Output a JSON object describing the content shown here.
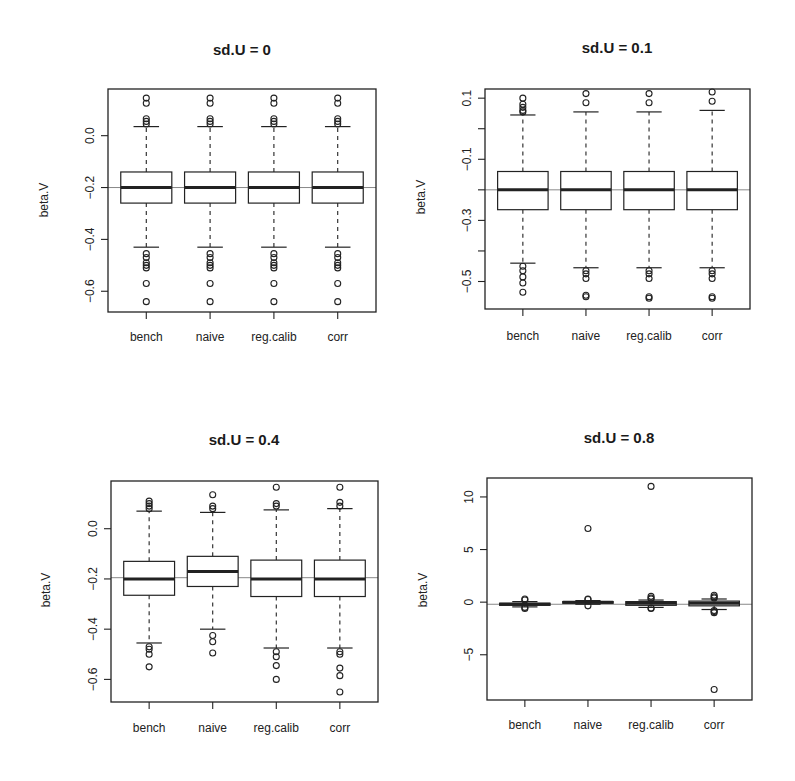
{
  "chart_data": [
    {
      "type": "boxplot",
      "title": "sd.U =  0",
      "xlabel": "",
      "ylabel": "beta.V",
      "categories": [
        "bench",
        "naive",
        "reg.calib",
        "corr"
      ],
      "ylim": [
        -0.68,
        0.18
      ],
      "yticks": [
        0.0,
        -0.2,
        -0.4,
        -0.6
      ],
      "ytick_labels": [
        "0.0",
        "-0.2",
        "-0.4",
        "-0.6"
      ],
      "reference_line": -0.2,
      "boxes": [
        {
          "q1": -0.26,
          "median": -0.2,
          "q3": -0.14,
          "whisker_low": -0.43,
          "whisker_high": 0.035,
          "outliers": [
            0.145,
            0.125,
            0.065,
            0.055,
            0.045,
            -0.455,
            -0.47,
            -0.49,
            -0.5,
            -0.51,
            -0.57,
            -0.64
          ]
        },
        {
          "q1": -0.26,
          "median": -0.2,
          "q3": -0.14,
          "whisker_low": -0.43,
          "whisker_high": 0.035,
          "outliers": [
            0.145,
            0.125,
            0.065,
            0.055,
            0.045,
            -0.455,
            -0.47,
            -0.49,
            -0.5,
            -0.51,
            -0.57,
            -0.64
          ]
        },
        {
          "q1": -0.26,
          "median": -0.2,
          "q3": -0.14,
          "whisker_low": -0.43,
          "whisker_high": 0.035,
          "outliers": [
            0.145,
            0.125,
            0.065,
            0.055,
            0.045,
            -0.455,
            -0.47,
            -0.49,
            -0.5,
            -0.51,
            -0.57,
            -0.64
          ]
        },
        {
          "q1": -0.26,
          "median": -0.2,
          "q3": -0.14,
          "whisker_low": -0.43,
          "whisker_high": 0.035,
          "outliers": [
            0.145,
            0.125,
            0.065,
            0.055,
            0.045,
            -0.455,
            -0.47,
            -0.49,
            -0.5,
            -0.51,
            -0.57,
            -0.64
          ]
        }
      ]
    },
    {
      "type": "boxplot",
      "title": "sd.U =  0.1",
      "xlabel": "",
      "ylabel": "beta.V",
      "categories": [
        "bench",
        "naive",
        "reg.calib",
        "corr"
      ],
      "ylim": [
        -0.59,
        0.13
      ],
      "yticks": [
        0.1,
        0.0,
        -0.1,
        -0.2,
        -0.3,
        -0.4,
        -0.5
      ],
      "ytick_labels": [
        "0.1",
        "",
        "-0.1",
        "",
        "-0.3",
        "",
        "-0.5"
      ],
      "reference_line": -0.2,
      "boxes": [
        {
          "q1": -0.265,
          "median": -0.2,
          "q3": -0.14,
          "whisker_low": -0.44,
          "whisker_high": 0.045,
          "outliers": [
            0.1,
            0.08,
            0.07,
            0.06,
            0.055,
            -0.45,
            -0.465,
            -0.485,
            -0.505,
            -0.535
          ]
        },
        {
          "q1": -0.265,
          "median": -0.2,
          "q3": -0.14,
          "whisker_low": -0.455,
          "whisker_high": 0.055,
          "outliers": [
            0.115,
            0.085,
            -0.465,
            -0.475,
            -0.49,
            -0.545,
            -0.55
          ]
        },
        {
          "q1": -0.265,
          "median": -0.2,
          "q3": -0.14,
          "whisker_low": -0.455,
          "whisker_high": 0.055,
          "outliers": [
            0.115,
            0.085,
            -0.465,
            -0.475,
            -0.49,
            -0.55,
            -0.555
          ]
        },
        {
          "q1": -0.265,
          "median": -0.2,
          "q3": -0.14,
          "whisker_low": -0.455,
          "whisker_high": 0.06,
          "outliers": [
            0.12,
            0.09,
            -0.465,
            -0.475,
            -0.49,
            -0.55,
            -0.555
          ]
        }
      ]
    },
    {
      "type": "boxplot",
      "title": "sd.U =  0.4",
      "xlabel": "",
      "ylabel": "beta.V",
      "categories": [
        "bench",
        "naive",
        "reg.calib",
        "corr"
      ],
      "ylim": [
        -0.69,
        0.19
      ],
      "yticks": [
        0.0,
        -0.2,
        -0.4,
        -0.6
      ],
      "ytick_labels": [
        "0.0",
        "-0.2",
        "-0.4",
        "-0.6"
      ],
      "reference_line": -0.195,
      "boxes": [
        {
          "q1": -0.265,
          "median": -0.2,
          "q3": -0.13,
          "whisker_low": -0.455,
          "whisker_high": 0.07,
          "outliers": [
            0.11,
            0.1,
            0.09,
            0.08,
            -0.47,
            -0.48,
            -0.5,
            -0.55
          ]
        },
        {
          "q1": -0.23,
          "median": -0.17,
          "q3": -0.11,
          "whisker_low": -0.4,
          "whisker_high": 0.065,
          "outliers": [
            0.135,
            0.09,
            0.08,
            -0.425,
            -0.45,
            -0.495
          ]
        },
        {
          "q1": -0.27,
          "median": -0.2,
          "q3": -0.125,
          "whisker_low": -0.475,
          "whisker_high": 0.075,
          "outliers": [
            0.165,
            0.1,
            0.09,
            -0.49,
            -0.51,
            -0.545,
            -0.6
          ]
        },
        {
          "q1": -0.27,
          "median": -0.2,
          "q3": -0.125,
          "whisker_low": -0.475,
          "whisker_high": 0.08,
          "outliers": [
            0.165,
            0.105,
            0.09,
            -0.49,
            -0.5,
            -0.555,
            -0.585,
            -0.65
          ]
        }
      ]
    },
    {
      "type": "boxplot",
      "title": "sd.U =  0.8",
      "xlabel": "",
      "ylabel": "beta.V",
      "categories": [
        "bench",
        "naive",
        "reg.calib",
        "corr"
      ],
      "ylim": [
        -9.3,
        11.8
      ],
      "yticks": [
        10,
        5,
        0,
        -5
      ],
      "ytick_labels": [
        "10",
        "5",
        "0",
        "-5"
      ],
      "reference_line": -0.2,
      "boxes": [
        {
          "q1": -0.3,
          "median": -0.2,
          "q3": -0.1,
          "whisker_low": -0.45,
          "whisker_high": 0.05,
          "outliers": [
            0.3,
            0.2,
            -0.5,
            -0.6
          ]
        },
        {
          "q1": -0.1,
          "median": 0.0,
          "q3": 0.05,
          "whisker_low": -0.2,
          "whisker_high": 0.15,
          "outliers": [
            7.0,
            0.3,
            0.25,
            -0.35
          ]
        },
        {
          "q1": -0.3,
          "median": -0.1,
          "q3": 0.05,
          "whisker_low": -0.5,
          "whisker_high": 0.2,
          "outliers": [
            11.0,
            0.55,
            0.4,
            0.3,
            -0.55,
            -0.6
          ]
        },
        {
          "q1": -0.35,
          "median": -0.1,
          "q3": 0.1,
          "whisker_low": -0.7,
          "whisker_high": 0.3,
          "outliers": [
            0.65,
            0.5,
            0.4,
            -0.8,
            -0.9,
            -1.0,
            -8.3
          ]
        }
      ]
    }
  ],
  "layout": {
    "panels": [
      {
        "frame": [
          108,
          89,
          376,
          312
        ],
        "title_pos": [
          242,
          55
        ],
        "ylabel_pos": [
          48,
          200
        ],
        "xlabel_y": 341
      },
      {
        "frame": [
          485,
          89,
          750,
          309
        ],
        "title_pos": [
          617,
          53
        ],
        "ylabel_pos": [
          425,
          197
        ],
        "xlabel_y": 340
      },
      {
        "frame": [
          111,
          481,
          378,
          702
        ],
        "title_pos": [
          244,
          445
        ],
        "ylabel_pos": [
          50,
          590
        ],
        "xlabel_y": 732
      },
      {
        "frame": [
          487,
          478,
          752,
          700
        ],
        "title_pos": [
          619,
          443
        ],
        "ylabel_pos": [
          427,
          590
        ],
        "xlabel_y": 729
      }
    ]
  }
}
